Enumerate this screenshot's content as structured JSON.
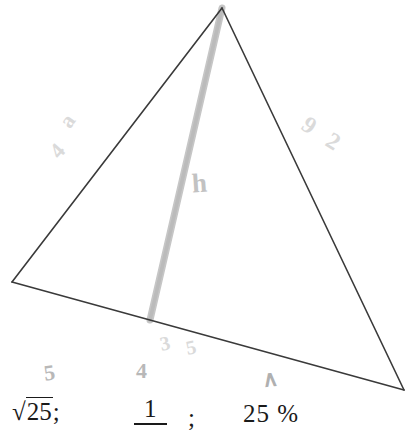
{
  "figure": {
    "type": "geometry-triangle-with-altitude",
    "triangle": {
      "apex": [
        222,
        8
      ],
      "bottom_left": [
        12,
        282
      ],
      "bottom_right": [
        404,
        390
      ],
      "stroke_color": "#3a3a3a"
    },
    "altitude": {
      "from": [
        222,
        8
      ],
      "to": [
        150,
        320
      ],
      "stroke_color": "#c4c4c4",
      "label": "h"
    }
  },
  "annotations": {
    "altitude_label": "h",
    "left_side_upper": "a",
    "left_side_lower": "4",
    "right_side_upper": "9",
    "right_side_lower": "2",
    "base_mark_left": "3",
    "base_mark_right": "5",
    "below_base_five": "5",
    "below_base_four": "4",
    "caret_mark": "∧"
  },
  "bottom_expressions": {
    "sqrt_label": "√",
    "sqrt_radicand": "25",
    "sqrt_separator": ";",
    "fraction_numerator": "1",
    "fraction_separator": ";",
    "percent_value": "25 %"
  },
  "colors": {
    "background": "#ffffff",
    "ink": "#1a1a1a",
    "pencil": "#c9c9c9",
    "pencil_faint": "#dadada",
    "line": "#3a3a3a"
  }
}
